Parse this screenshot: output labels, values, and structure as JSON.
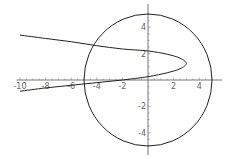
{
  "chart_data": {
    "type": "line",
    "title": "",
    "xlabel": "",
    "ylabel": "",
    "xlim": [
      -10.5,
      5.5
    ],
    "ylim": [
      -5.2,
      5.2
    ],
    "grid": false,
    "legend": null,
    "x_ticks": [
      -10,
      -8,
      -6,
      -4,
      -2,
      2,
      4
    ],
    "x_tick_labels": [
      "-10",
      "-8",
      "-6",
      "-4",
      "-2",
      "2",
      "4"
    ],
    "y_ticks": [
      4,
      2,
      -2,
      -4
    ],
    "y_tick_labels": [
      "4",
      "2",
      "-2",
      "-4"
    ],
    "series": [
      {
        "name": "circle",
        "description": "circle of radius 5 centered at origin",
        "center": [
          0,
          0
        ],
        "radius": 5
      },
      {
        "name": "sideways-parabola",
        "points": [
          [
            -10,
            3.4
          ],
          [
            -8,
            3.15
          ],
          [
            -6,
            2.9
          ],
          [
            -4,
            2.6
          ],
          [
            -2,
            2.35
          ],
          [
            0,
            2.2
          ],
          [
            1.5,
            1.95
          ],
          [
            2.5,
            1.65
          ],
          [
            3.0,
            1.25
          ],
          [
            2.5,
            0.85
          ],
          [
            1.5,
            0.55
          ],
          [
            0,
            0.25
          ],
          [
            -2,
            0.0
          ],
          [
            -4,
            -0.2
          ],
          [
            -6,
            -0.4
          ],
          [
            -8,
            -0.6
          ],
          [
            -10,
            -0.85
          ]
        ]
      }
    ]
  }
}
